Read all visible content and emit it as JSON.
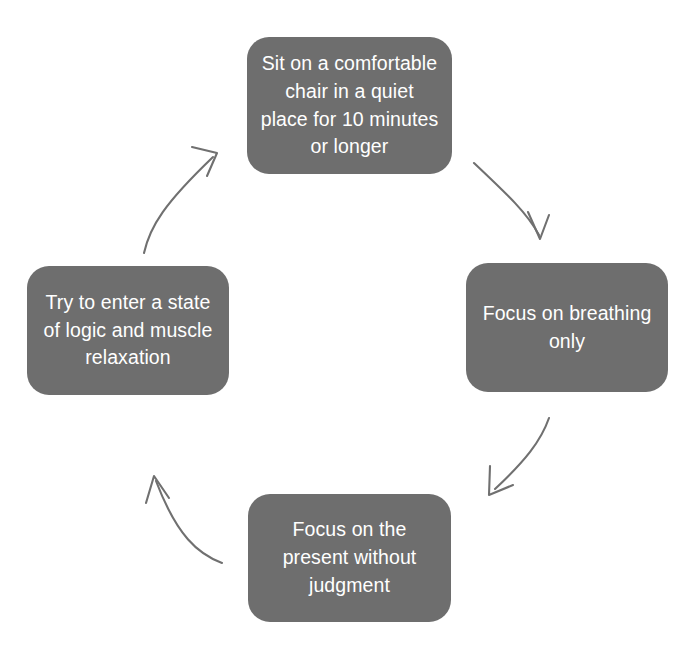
{
  "diagram": {
    "type": "cycle",
    "orientation": "clockwise",
    "node_fill_color": "#6e6e6e",
    "node_text_color": "#ffffff",
    "arrow_color": "#707070",
    "background_color": "#ffffff",
    "nodes": [
      {
        "id": "node-top",
        "position": "top",
        "order": 1,
        "text": "Sit on a comfortable\nchair in a quiet\nplace for 10 minutes\nor longer"
      },
      {
        "id": "node-right",
        "position": "right",
        "order": 2,
        "text": "Focus on breathing\nonly"
      },
      {
        "id": "node-bottom",
        "position": "bottom",
        "order": 3,
        "text": "Focus on the\npresent without\njudgment"
      },
      {
        "id": "node-left",
        "position": "left",
        "order": 4,
        "text": "Try to enter a state\nof logic and  muscle\nrelaxation"
      }
    ],
    "arrows": [
      {
        "id": "arrow-top-to-right",
        "from": "node-top",
        "to": "node-right",
        "direction": "down-right",
        "icon": "curved-arrow-icon"
      },
      {
        "id": "arrow-right-to-bottom",
        "from": "node-right",
        "to": "node-bottom",
        "direction": "down-left",
        "icon": "curved-arrow-icon"
      },
      {
        "id": "arrow-bottom-to-left",
        "from": "node-bottom",
        "to": "node-left",
        "direction": "up-left",
        "icon": "curved-arrow-icon"
      },
      {
        "id": "arrow-left-to-top",
        "from": "node-left",
        "to": "node-top",
        "direction": "up-right",
        "icon": "curved-arrow-icon"
      }
    ]
  }
}
